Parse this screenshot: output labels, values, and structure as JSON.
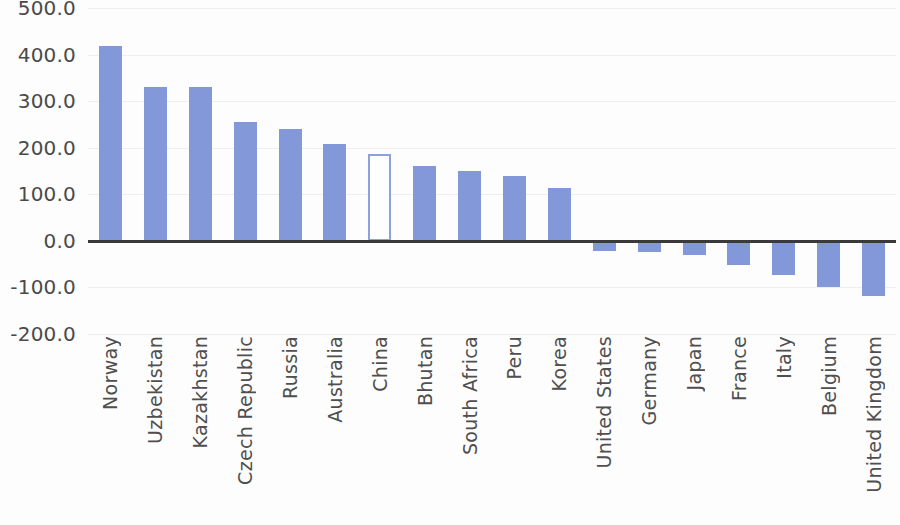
{
  "chart_data": {
    "type": "bar",
    "title": "",
    "subtitle": "",
    "xlabel": "",
    "ylabel": "",
    "ylim": [
      -200.0,
      500.0
    ],
    "grid": true,
    "legend": "none",
    "y_ticks": [
      "500.0",
      "400.0",
      "300.0",
      "200.0",
      "100.0",
      "0.0",
      "-100.0",
      "-200.0"
    ],
    "y_tick_values": [
      500,
      400,
      300,
      200,
      100,
      0,
      -100,
      -200
    ],
    "zero_line": 0,
    "categories": [
      "Norway",
      "Uzbekistan",
      "Kazakhstan",
      "Czech Republic",
      "Russia",
      "Australia",
      "China",
      "Bhutan",
      "South Africa",
      "Peru",
      "Korea",
      "United States",
      "Germany",
      "Japan",
      "France",
      "Italy",
      "Belgium",
      "United Kingdom"
    ],
    "values": [
      418,
      330,
      330,
      256,
      240,
      208,
      186,
      160,
      151,
      140,
      113,
      -22,
      -23,
      -30,
      -52,
      -73,
      -100,
      -118
    ],
    "highlighted_category": "China",
    "highlight_style": "hollow-outline",
    "colors": {
      "bar_fill": "#8298d8",
      "bar_outline": "#8da2dc",
      "highlight_fill": "#ffffff",
      "zero_line": "#3a3a3a",
      "gridline": "#eceef2",
      "tick_text": "#4a4a4a",
      "category_text": "#4f4f4f",
      "background": "#fdfdfd"
    }
  }
}
